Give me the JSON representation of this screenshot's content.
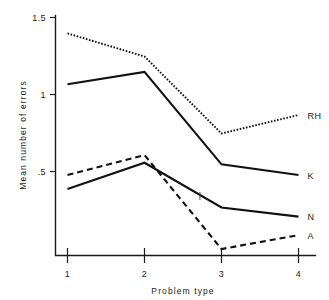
{
  "chart_data": {
    "type": "line",
    "title": "",
    "xlabel": "Problem type",
    "ylabel": "Mean number of errors",
    "categories": [
      "1",
      "2",
      "3",
      "4"
    ],
    "x": [
      1,
      2,
      3,
      4
    ],
    "xlim": [
      0.7,
      4.3
    ],
    "ylim": [
      0.0,
      1.5
    ],
    "ytick_labels": [
      "1.5",
      "1",
      ".5"
    ],
    "ytick_values": [
      1.5,
      1.0,
      0.5
    ],
    "xtick_labels": [
      "1",
      "2",
      "3",
      "4"
    ],
    "grid": false,
    "legend_position": "right-inline-end-of-line",
    "series": [
      {
        "name": "RH",
        "label": "RH",
        "style": "dotted",
        "color": "#111111",
        "values": [
          1.4,
          1.25,
          0.75,
          0.87
        ]
      },
      {
        "name": "K",
        "label": "K",
        "style": "solid",
        "color": "#111111",
        "values": [
          1.07,
          1.15,
          0.55,
          0.48
        ]
      },
      {
        "name": "A",
        "label": "A",
        "style": "dashed",
        "color": "#111111",
        "values": [
          0.48,
          0.61,
          0.0,
          0.09
        ]
      },
      {
        "name": "N",
        "label": "N",
        "style": "solid",
        "color": "#111111",
        "values": [
          0.39,
          0.56,
          0.27,
          0.21
        ]
      }
    ],
    "annotations": [
      {
        "name": "stray-tick-mark",
        "x": 2.72,
        "y": 0.345
      }
    ]
  },
  "labels": {
    "y_axis_title": "Mean number of errors",
    "x_axis_title": "Problem type",
    "ytick_1": "1.5",
    "ytick_2": "1",
    "ytick_3": ".5",
    "xtick_1": "1",
    "xtick_2": "2",
    "xtick_3": "3",
    "xtick_4": "4",
    "series_rh": "RH",
    "series_k": "K",
    "series_n": "N",
    "series_a": "A"
  },
  "colors": {
    "ink": "#111111",
    "background": "#ffffff"
  }
}
